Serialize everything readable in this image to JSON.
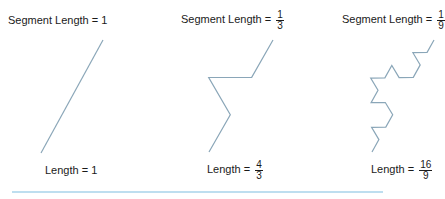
{
  "panels": [
    {
      "segment_label": "Segment Length =",
      "segment_value": "1",
      "length_label": "Length =",
      "length_value": "1",
      "iterations": 0,
      "start": [
        41,
        153
      ],
      "end": [
        103,
        40
      ]
    },
    {
      "segment_label": "Segment Length =",
      "segment_num": "1",
      "segment_den": "3",
      "length_label": "Length =",
      "length_num": "4",
      "length_den": "3",
      "iterations": 1,
      "start": [
        209,
        152
      ],
      "end": [
        273,
        40
      ]
    },
    {
      "segment_label": "Segment Length =",
      "segment_num": "1",
      "segment_den": "9",
      "length_label": "Length =",
      "length_num": "16",
      "length_den": "9",
      "iterations": 2,
      "start": [
        372,
        152
      ],
      "end": [
        434,
        40
      ]
    }
  ],
  "colors": {
    "curve": "#8aa6b8",
    "rule": "#7fbde0",
    "text": "#1a1a1a"
  },
  "rule": {
    "x1": 12,
    "x2": 383,
    "y": 192
  }
}
